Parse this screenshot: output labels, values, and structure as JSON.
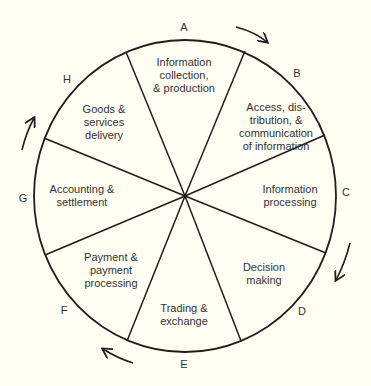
{
  "diagram": {
    "type": "cycle-wheel",
    "direction": "clockwise",
    "segments": [
      {
        "letter": "A",
        "label": "Information\ncollection,\n& production"
      },
      {
        "letter": "B",
        "label": "Access, dis-\ntribution, &\ncommunication\nof information"
      },
      {
        "letter": "C",
        "label": "Information\nprocessing"
      },
      {
        "letter": "D",
        "label": "Decision\nmaking"
      },
      {
        "letter": "E",
        "label": "Trading &\nexchange"
      },
      {
        "letter": "F",
        "label": "Payment &\npayment\nprocessing"
      },
      {
        "letter": "G",
        "label": "Accounting &\nsettlement"
      },
      {
        "letter": "H",
        "label": "Goods &\nservices\ndelivery"
      }
    ],
    "colors": {
      "background": "#fffef3",
      "stroke": "#1e1e1e",
      "text": "#333333"
    }
  }
}
